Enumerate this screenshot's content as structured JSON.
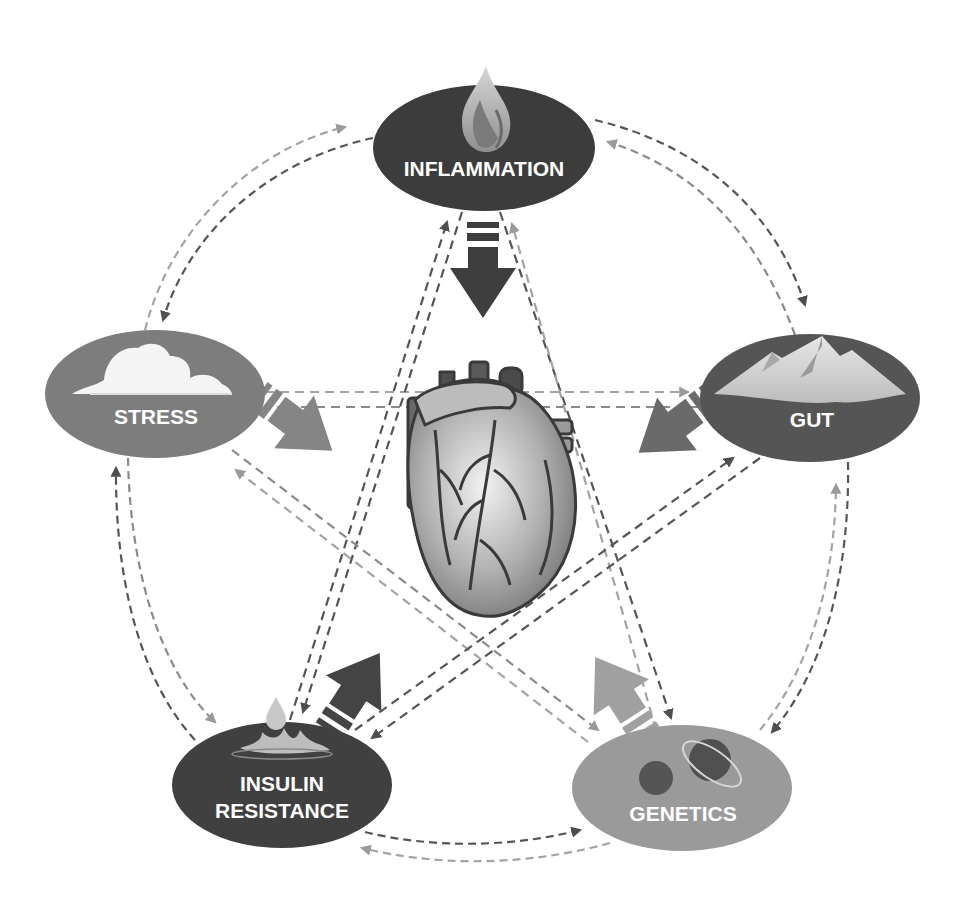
{
  "diagram": {
    "center": {
      "label": "heart",
      "icon": "heart-anatomical-icon"
    },
    "nodes": [
      {
        "id": "inflammation",
        "label": "INFLAMMATION",
        "icon": "flame-icon",
        "fill": "#3c3c3c",
        "cx": 484,
        "cy": 148
      },
      {
        "id": "stress",
        "label": "STRESS",
        "icon": "cloud-icon",
        "fill": "#7d7d7d",
        "cx": 155,
        "cy": 394
      },
      {
        "id": "gut",
        "label": "GUT",
        "icon": "mountain-icon",
        "fill": "#555555",
        "cx": 810,
        "cy": 398
      },
      {
        "id": "insulin",
        "label_line1": "INSULIN",
        "label_line2": "RESISTANCE",
        "icon": "water-drop-splash-icon",
        "fill": "#404040",
        "cx": 282,
        "cy": 785
      },
      {
        "id": "genetics",
        "label": "GENETICS",
        "icon": "planets-icon",
        "fill": "#9a9a9a",
        "cx": 682,
        "cy": 788
      }
    ],
    "edge_style": {
      "dark": "#555555",
      "light": "#a3a3a3",
      "type": "dashed-bidirectional"
    },
    "big_arrows": [
      {
        "from": "inflammation",
        "to": "heart",
        "color": "#3e3e3e"
      },
      {
        "from": "stress",
        "to": "heart",
        "color": "#858585"
      },
      {
        "from": "gut",
        "to": "heart",
        "color": "#6a6a6a"
      },
      {
        "from": "insulin",
        "to": "heart",
        "color": "#444444"
      },
      {
        "from": "genetics",
        "to": "heart",
        "color": "#a0a0a0"
      }
    ]
  }
}
